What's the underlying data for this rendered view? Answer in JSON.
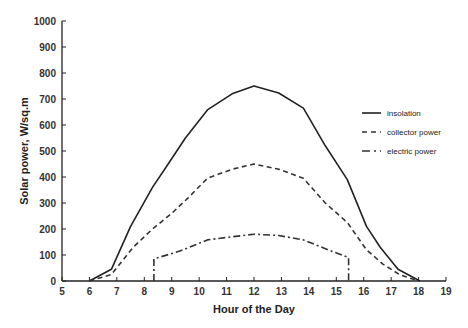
{
  "chart_data": {
    "type": "line",
    "title": "",
    "xlabel": "Hour of the Day",
    "ylabel": "Solar power, W/sq.m",
    "xlim": [
      5,
      19
    ],
    "ylim": [
      0,
      1000
    ],
    "xticks": [
      5,
      6,
      7,
      8,
      9,
      10,
      11,
      12,
      13,
      14,
      15,
      16,
      17,
      18,
      19
    ],
    "yticks": [
      0,
      100,
      200,
      300,
      400,
      500,
      600,
      700,
      800,
      900,
      1000
    ],
    "grid": false,
    "legend_position": "right",
    "series": [
      {
        "name": "insolation",
        "style": "solid",
        "color": "#222222",
        "x": [
          6.0,
          6.8,
          7.5,
          8.3,
          8.9,
          9.5,
          10.3,
          11.2,
          12.0,
          12.9,
          13.8,
          14.6,
          15.4,
          16.1,
          16.6,
          17.25,
          18.05
        ],
        "y": [
          0,
          45,
          210,
          360,
          455,
          550,
          658,
          720,
          750,
          723,
          665,
          520,
          390,
          210,
          130,
          45,
          0
        ]
      },
      {
        "name": "collector power",
        "style": "dashed",
        "color": "#333333",
        "x": [
          6.0,
          6.8,
          7.6,
          8.3,
          9.0,
          9.6,
          10.3,
          11.2,
          12.0,
          12.9,
          13.8,
          14.6,
          15.4,
          16.1,
          16.7,
          17.3,
          18.0
        ],
        "y": [
          0,
          25,
          130,
          200,
          260,
          320,
          395,
          430,
          450,
          430,
          395,
          300,
          225,
          120,
          65,
          25,
          0
        ]
      },
      {
        "name": "electric power",
        "style": "dash-dot",
        "color": "#333333",
        "x": [
          8.35,
          8.35,
          9.3,
          10.3,
          11.2,
          12.0,
          12.9,
          13.8,
          14.7,
          15.45,
          15.45
        ],
        "y": [
          0,
          85,
          115,
          158,
          170,
          180,
          175,
          158,
          120,
          90,
          0
        ]
      }
    ]
  }
}
